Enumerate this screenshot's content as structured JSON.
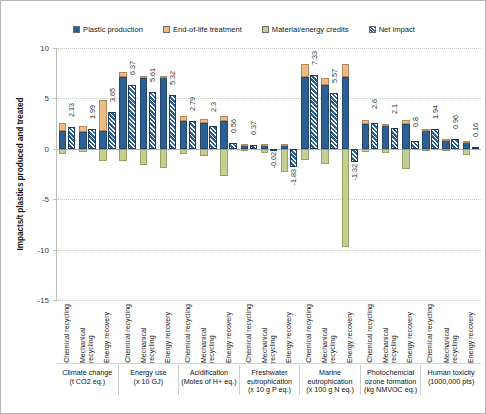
{
  "legend": {
    "items": [
      {
        "label": "Plastic production",
        "color": "#2c5f94",
        "key": "production"
      },
      {
        "label": "End-of-life treatment",
        "color": "#eabd88",
        "key": "eol"
      },
      {
        "label": "Material/energy credits",
        "color": "#c5cf93",
        "key": "credits"
      },
      {
        "label": "Net impact",
        "color": "#2c5f94",
        "key": "net"
      }
    ]
  },
  "axis": {
    "y_title": "Impacts/t plastics produced and treated",
    "y_ticks": [
      10,
      5,
      0,
      -5,
      -10,
      -15
    ],
    "y_min": -15,
    "y_max": 10
  },
  "chart_data": {
    "type": "bar",
    "title": "",
    "xlabel": "",
    "ylabel": "Impacts/t plastics produced and treated",
    "ylim": [
      -15,
      10
    ],
    "grid": true,
    "legend_position": "top",
    "legend_entries": [
      "Plastic production",
      "End-of-life treatment",
      "Material/energy credits",
      "Net impact"
    ],
    "categories": [
      "Climate change (t CO2 eq.)",
      "Energy use (x 10 GJ)",
      "Acidification (Moles of H+ eq.)",
      "Freshwater eutrophication (x 10 g P eq.)",
      "Marine eutrophication (x 100 g N eq.)",
      "Photochemcial ozone formation (kg NMVOC eq.)",
      "Human toxicity (1000,000 pts)"
    ],
    "subcategories": [
      "Chemical recycling",
      "Mechanical recycling",
      "Energy recovery"
    ],
    "groups": [
      {
        "name": "Climate change",
        "unit": "(t CO2 eq.)",
        "bars": [
          {
            "scenario": "Chemical recycling",
            "production": 1.75,
            "eol": 0.85,
            "credits": -0.47,
            "net": 2.13
          },
          {
            "scenario": "Mechanical recycling",
            "production": 1.68,
            "eol": 0.6,
            "credits": -0.29,
            "net": 1.99
          },
          {
            "scenario": "Energy recovery",
            "production": 1.75,
            "eol": 3.1,
            "credits": -1.2,
            "net": 3.65
          }
        ]
      },
      {
        "name": "Energy use",
        "unit": "(x 10 GJ)",
        "bars": [
          {
            "scenario": "Chemical recycling",
            "production": 7.15,
            "eol": 0.45,
            "credits": -1.23,
            "net": 6.37
          },
          {
            "scenario": "Mechanical recycling",
            "production": 7.05,
            "eol": 0.2,
            "credits": -1.64,
            "net": 5.61
          },
          {
            "scenario": "Energy recovery",
            "production": 7.15,
            "eol": 0.1,
            "credits": -1.93,
            "net": 5.32
          }
        ]
      },
      {
        "name": "Acidification",
        "unit": "(Moles of H+ eq.)",
        "bars": [
          {
            "scenario": "Chemical recycling",
            "production": 2.75,
            "eol": 0.52,
            "credits": -0.48,
            "net": 2.79
          },
          {
            "scenario": "Mechanical recycling",
            "production": 2.55,
            "eol": 0.42,
            "credits": -0.67,
            "net": 2.3
          },
          {
            "scenario": "Energy recovery",
            "production": 2.75,
            "eol": 0.48,
            "credits": -2.67,
            "net": 0.56
          }
        ]
      },
      {
        "name": "Freshwater eutrophication",
        "unit": "(x 10 g P eq.)",
        "bars": [
          {
            "scenario": "Chemical recycling",
            "production": 0.42,
            "eol": 0.08,
            "credits": -0.13,
            "net": 0.37
          },
          {
            "scenario": "Mechanical recycling",
            "production": 0.38,
            "eol": 0.05,
            "credits": -0.45,
            "net": -0.02
          },
          {
            "scenario": "Energy recovery",
            "production": 0.42,
            "eol": 0.05,
            "credits": -2.3,
            "net": -1.83
          }
        ]
      },
      {
        "name": "Marine eutrophication",
        "unit": "(x 100 g N eq.)",
        "bars": [
          {
            "scenario": "Chemical recycling",
            "production": 7.1,
            "eol": 1.35,
            "credits": -1.12,
            "net": 7.33
          },
          {
            "scenario": "Mechanical recycling",
            "production": 6.3,
            "eol": 0.75,
            "credits": -1.48,
            "net": 5.57
          },
          {
            "scenario": "Energy recovery",
            "production": 7.1,
            "eol": 1.3,
            "credits": -9.72,
            "net": -1.32
          }
        ]
      },
      {
        "name": "Photochemcial ozone formation",
        "unit": "(kg NMVOC eq.)",
        "bars": [
          {
            "scenario": "Chemical recycling",
            "production": 2.45,
            "eol": 0.45,
            "credits": -0.3,
            "net": 2.6
          },
          {
            "scenario": "Mechanical recycling",
            "production": 2.45,
            "eol": 0.05,
            "credits": -0.4,
            "net": 2.1
          },
          {
            "scenario": "Energy recovery",
            "production": 2.45,
            "eol": 0.38,
            "credits": -2.03,
            "net": 0.8
          }
        ]
      },
      {
        "name": "Human toxicity",
        "unit": "(1000,000 pts)",
        "bars": [
          {
            "scenario": "Chemical recycling",
            "production": 1.94,
            "eol": 0.02,
            "credits": -0.02,
            "net": 1.94
          },
          {
            "scenario": "Mechanical recycling",
            "production": 0.98,
            "eol": 0.02,
            "credits": -0.04,
            "net": 0.96
          },
          {
            "scenario": "Energy recovery",
            "production": 0.78,
            "eol": 0.02,
            "credits": -0.64,
            "net": 0.16
          }
        ]
      }
    ]
  }
}
